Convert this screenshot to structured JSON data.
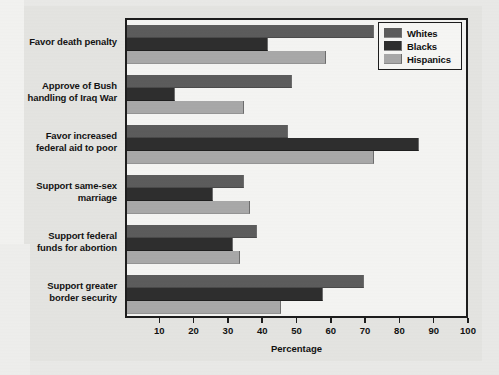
{
  "chart_data": {
    "type": "bar",
    "orientation": "horizontal",
    "title": "",
    "xlabel": "Percentage",
    "ylabel": "",
    "xlim": [
      0,
      100
    ],
    "xticks": [
      10,
      20,
      30,
      40,
      50,
      60,
      70,
      80,
      90,
      100
    ],
    "grid": false,
    "legend_position": "top-right",
    "categories": [
      "Favor death penalty",
      "Approve of Bush handling of Iraq War",
      "Favor increased federal aid to poor",
      "Support same-sex marriage",
      "Support federal funds for abortion",
      "Support greater border security"
    ],
    "series": [
      {
        "name": "Whites",
        "color": "#5c5c5c",
        "values": [
          72,
          48,
          47,
          34,
          38,
          69
        ]
      },
      {
        "name": "Blacks",
        "color": "#2e2e2e",
        "values": [
          41,
          14,
          85,
          25,
          31,
          57
        ]
      },
      {
        "name": "Hispanics",
        "color": "#a8a8a8",
        "values": [
          58,
          34,
          72,
          36,
          33,
          45
        ]
      }
    ]
  },
  "axis": {
    "x_title": "Percentage",
    "x_tick_labels": [
      "10",
      "20",
      "30",
      "40",
      "50",
      "60",
      "70",
      "80",
      "90",
      "100"
    ]
  },
  "legend": {
    "items": [
      {
        "label": "Whites"
      },
      {
        "label": "Blacks"
      },
      {
        "label": "Hispanics"
      }
    ]
  },
  "category_labels": [
    {
      "line1": "Favor death penalty",
      "line2": ""
    },
    {
      "line1": "Approve of Bush",
      "line2": "handling of Iraq War"
    },
    {
      "line1": "Favor increased",
      "line2": "federal aid to poor"
    },
    {
      "line1": "Support same-sex",
      "line2": "marriage"
    },
    {
      "line1": "Support federal",
      "line2": "funds for abortion"
    },
    {
      "line1": "Support greater",
      "line2": "border security"
    }
  ],
  "colors": {
    "whites": "#5c5c5c",
    "blacks": "#2e2e2e",
    "hispanics": "#a8a8a8",
    "frame": "#1d1d1d",
    "plot_background": "#f4f4f2",
    "page_background": "#e4e4e1"
  }
}
